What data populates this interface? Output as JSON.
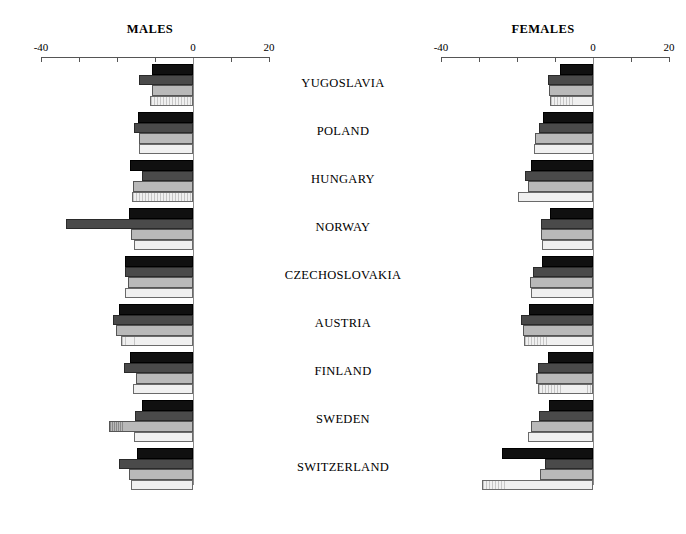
{
  "figure": {
    "width": 686,
    "height": 534,
    "background": "#ffffff"
  },
  "panels": {
    "males": {
      "title": "MALES"
    },
    "females": {
      "title": "FEMALES"
    }
  },
  "axis": {
    "tick_labels_shown": [
      "-40",
      "0",
      "20"
    ],
    "min": -40,
    "max": 20,
    "tick_step": 10,
    "all_ticks": [
      -40,
      -30,
      -20,
      -10,
      0,
      10,
      20
    ],
    "label_left": "-40",
    "label_zero": "0",
    "label_right": "20"
  },
  "countries": [
    "YUGOSLAVIA",
    "POLAND",
    "HUNGARY",
    "NORWAY",
    "CZECHOSLOVAKIA",
    "AUSTRIA",
    "FINLAND",
    "SWEDEN",
    "SWITZERLAND"
  ],
  "series_names": [
    "series-1",
    "series-2",
    "series-3",
    "series-4"
  ],
  "series_colors": [
    "#101010",
    "#4a4a4a",
    "#b9b9b9",
    "#f0f0f0"
  ],
  "chart_data": {
    "type": "bar",
    "orientation": "horizontal",
    "title": "",
    "xlabel": "",
    "ylabel": "",
    "xlim": [
      -40,
      20
    ],
    "grid": false,
    "legend": "none",
    "tick_values": [
      -40,
      -30,
      -20,
      -10,
      0,
      10,
      20
    ],
    "tick_labels": [
      "-40",
      "",
      "",
      "",
      "0",
      "",
      "20"
    ],
    "categories": [
      "YUGOSLAVIA",
      "POLAND",
      "HUNGARY",
      "NORWAY",
      "CZECHOSLOVAKIA",
      "AUSTRIA",
      "FINLAND",
      "SWEDEN",
      "SWITZERLAND"
    ],
    "panels": [
      {
        "name": "MALES",
        "series": [
          {
            "name": "series-1",
            "values": [
              -10.8,
              -14.5,
              -16.6,
              -16.9,
              -17.9,
              -19.5,
              -16.6,
              -13.4,
              -14.8
            ]
          },
          {
            "name": "series-2",
            "values": [
              -14.2,
              -15.5,
              -13.4,
              -33.4,
              -17.9,
              -21.1,
              -18.2,
              -15.3,
              -19.5
            ]
          },
          {
            "name": "series-3",
            "values": [
              -10.8,
              -14.2,
              -15.8,
              -16.3,
              -17.1,
              -20.3,
              -15.0,
              -22.1,
              -16.9
            ]
          },
          {
            "name": "series-4",
            "values": [
              -11.3,
              -14.2,
              -16.1,
              -15.5,
              -17.9,
              -19.0,
              -15.8,
              -15.5,
              -16.3
            ]
          }
        ]
      },
      {
        "name": "FEMALES",
        "series": [
          {
            "name": "series-1",
            "values": [
              -8.7,
              -13.2,
              -16.3,
              -11.3,
              -13.4,
              -16.9,
              -11.8,
              -11.6,
              -23.9
            ]
          },
          {
            "name": "series-2",
            "values": [
              -11.8,
              -14.2,
              -17.9,
              -13.7,
              -15.8,
              -18.9,
              -14.5,
              -14.2,
              -12.6
            ]
          },
          {
            "name": "series-3",
            "values": [
              -11.6,
              -15.3,
              -17.1,
              -13.7,
              -16.6,
              -18.4,
              -15.0,
              -16.3,
              -13.9
            ]
          },
          {
            "name": "series-4",
            "values": [
              -11.3,
              -15.5,
              -19.7,
              -13.4,
              -16.3,
              -18.2,
              -14.5,
              -17.1,
              -29.2
            ]
          }
        ]
      }
    ]
  },
  "geometry": {
    "males_axis_x0": 41,
    "males_axis_zero": 193,
    "males_axis_x1": 270,
    "females_axis_x0": 441,
    "females_axis_zero": 593,
    "females_axis_x1": 670,
    "axis_y": 57,
    "px_per_unit": 3.8,
    "group_top": 64,
    "group_pitch": 48,
    "bar_height": 10.5
  }
}
